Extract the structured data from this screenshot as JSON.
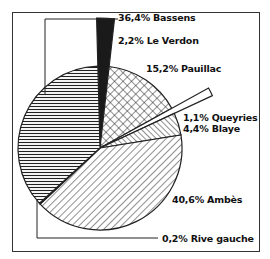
{
  "chart_data": {
    "type": "pie",
    "title": "",
    "slices": [
      {
        "label": "Bassens",
        "value": 36.4,
        "pattern": "horizontal-lines"
      },
      {
        "label": "Le Verdon",
        "value": 2.2,
        "pattern": "solid-black",
        "exploded": true
      },
      {
        "label": "Pauillac",
        "value": 15.2,
        "pattern": "crosshatch"
      },
      {
        "label": "Queyries",
        "value": 1.1,
        "pattern": "white",
        "exploded": true
      },
      {
        "label": "Blaye",
        "value": 4.4,
        "pattern": "back-diagonal"
      },
      {
        "label": "Ambès",
        "value": 40.6,
        "pattern": "diagonal-lines"
      },
      {
        "label": "Rive gauche",
        "value": 0.2,
        "pattern": "white"
      }
    ],
    "legend": "none (direct labels)"
  },
  "labels": {
    "bassens": "36,4% Bassens",
    "le_verdon": "2,2% Le Verdon",
    "pauillac": "15,2% Pauillac",
    "queyries": "1,1% Queyries",
    "blaye": "4,4% Blaye",
    "ambes": "40,6% Ambès",
    "rive_gauche": "0,2% Rive gauche"
  }
}
